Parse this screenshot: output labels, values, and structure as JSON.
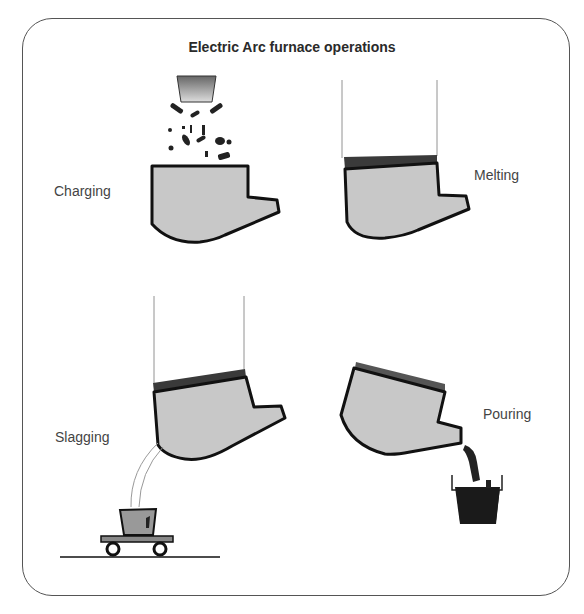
{
  "diagram": {
    "title": "Electric Arc furnace operations",
    "stages": [
      {
        "label": "Charging",
        "position": "top-left"
      },
      {
        "label": "Melting",
        "position": "top-right"
      },
      {
        "label": "Slagging",
        "position": "bottom-left"
      },
      {
        "label": "Pouring",
        "position": "bottom-right"
      }
    ],
    "colors": {
      "furnace_fill": "#c8c8c8",
      "furnace_outline": "#111111",
      "roof": "#444444",
      "frame_border": "#555555"
    }
  }
}
